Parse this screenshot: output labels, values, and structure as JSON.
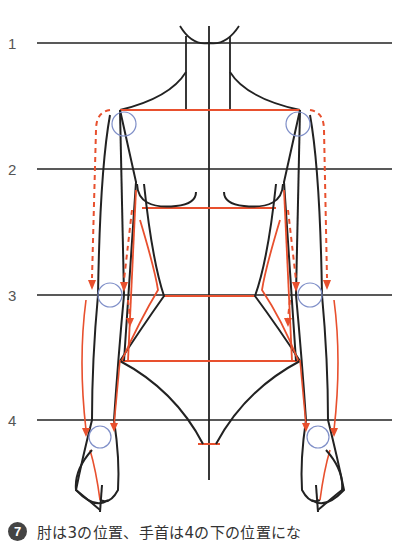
{
  "diagram": {
    "rows": [
      {
        "label": "1",
        "y": 43
      },
      {
        "label": "2",
        "y": 169
      },
      {
        "label": "3",
        "y": 295
      },
      {
        "label": "4",
        "y": 420
      }
    ],
    "colors": {
      "outline": "#222222",
      "guide": "#e8502e",
      "joint": "#7f8fc8"
    }
  },
  "caption": {
    "step_number": "7",
    "text": "肘は3の位置、手首は4の下の位置にな"
  }
}
